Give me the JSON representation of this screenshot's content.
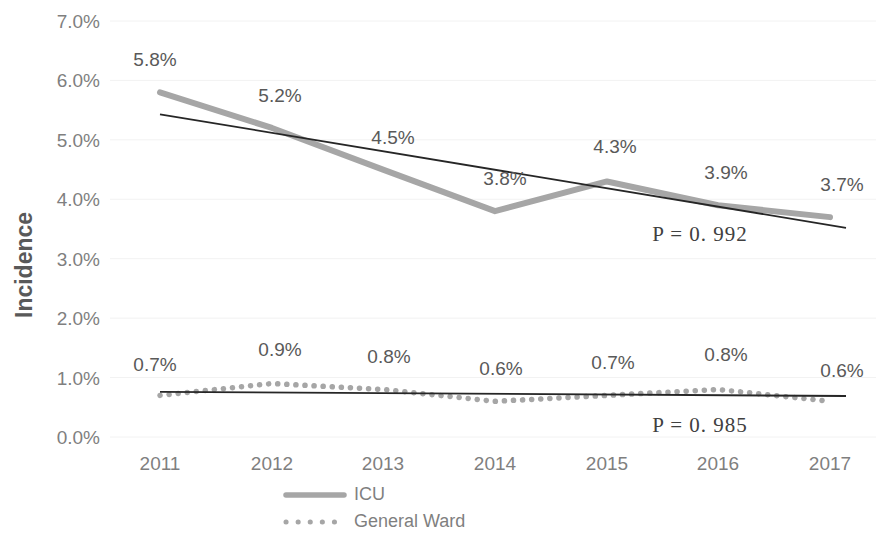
{
  "chart_data": {
    "type": "line",
    "title": "",
    "xlabel": "",
    "ylabel": "Incidence",
    "categories": [
      "2011",
      "2012",
      "2013",
      "2014",
      "2015",
      "2016",
      "2017"
    ],
    "ylim": [
      0.0,
      7.0
    ],
    "ytick_labels": [
      "0.0%",
      "1.0%",
      "2.0%",
      "3.0%",
      "4.0%",
      "5.0%",
      "6.0%",
      "7.0%"
    ],
    "ytick_values": [
      0.0,
      1.0,
      2.0,
      3.0,
      4.0,
      5.0,
      6.0,
      7.0
    ],
    "grid": true,
    "legend_position": "bottom",
    "series": [
      {
        "name": "ICU",
        "style": "solid-thick",
        "color": "#a6a6a6",
        "values": [
          5.8,
          5.2,
          4.5,
          3.8,
          4.3,
          3.9,
          3.7
        ],
        "value_labels": [
          "5.8%",
          "5.2%",
          "4.5%",
          "3.8%",
          "4.3%",
          "3.9%",
          "3.7%"
        ],
        "trendline": {
          "start": 5.43,
          "end": 3.52,
          "color": "#262626",
          "annotation": "P  =  0. 992"
        }
      },
      {
        "name": "General Ward",
        "style": "dotted",
        "color": "#a6a6a6",
        "values": [
          0.7,
          0.9,
          0.8,
          0.6,
          0.7,
          0.8,
          0.6
        ],
        "value_labels": [
          "0.7%",
          "0.9%",
          "0.8%",
          "0.6%",
          "0.7%",
          "0.8%",
          "0.6%"
        ],
        "trendline": {
          "start": 0.76,
          "end": 0.69,
          "color": "#262626",
          "annotation": "P  =  0. 985"
        }
      }
    ]
  },
  "legend": {
    "items": [
      {
        "label": "ICU",
        "marker": "solid-line-marker",
        "color": "#a6a6a6"
      },
      {
        "label": "General Ward",
        "marker": "dotted-line-marker",
        "color": "#a6a6a6"
      }
    ]
  },
  "colors": {
    "series_gray": "#a6a6a6",
    "trendline_black": "#262626",
    "gridline": "#f2f2f2",
    "tick_text": "#7f7f7f",
    "label_text": "#595959",
    "background": "#ffffff"
  }
}
